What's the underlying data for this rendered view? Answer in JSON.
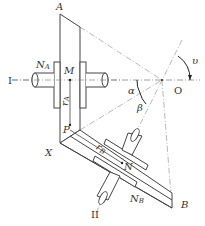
{
  "diagram": {
    "labels": {
      "A": "A",
      "B": "B",
      "O": "O",
      "X": "X",
      "M": "M",
      "N": "N",
      "P": "P",
      "shaft_I": "I",
      "shaft_II": "II",
      "NA_main": "N",
      "NA_sub": "A",
      "NB_main": "N",
      "NB_sub": "B",
      "rA_main": "r",
      "rA_sub": "A",
      "rB_main": "r",
      "rB_sub": "B",
      "alpha": "α",
      "beta": "β",
      "upsilon": "υ"
    },
    "colors": {
      "line": "#444444",
      "dash": "#888888",
      "background": "#ffffff"
    }
  }
}
